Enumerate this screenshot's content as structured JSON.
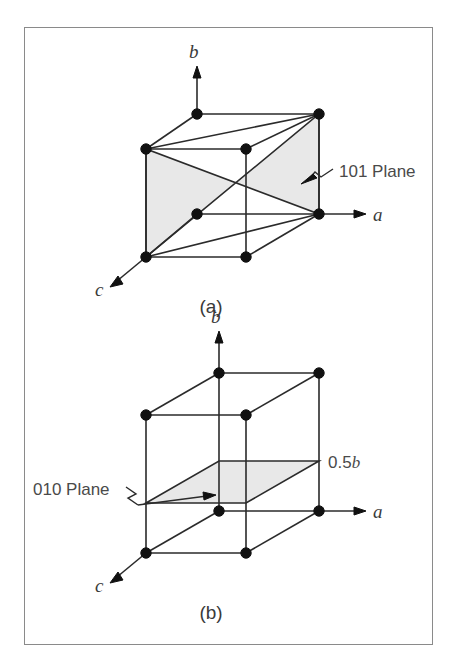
{
  "figure": {
    "background_color": "#ffffff",
    "frame_color": "#8a8a8a",
    "edge_color": "#2b2b2b",
    "vertex_color": "#111111",
    "plane_fill_color": "#e8e8e8",
    "text_color": "#3a3a3a"
  },
  "panel_a": {
    "caption": "(a)",
    "axis_a": "a",
    "axis_b": "b",
    "axis_c": "c",
    "plane_label": "101 Plane"
  },
  "panel_b": {
    "caption": "(b)",
    "axis_a": "a",
    "axis_b": "b",
    "axis_c": "c",
    "plane_label": "010 Plane",
    "height_label_value": "0.5",
    "height_label_axis": "b"
  },
  "chart_data": {
    "type": "diagram",
    "panels": [
      {
        "id": "a",
        "caption": "(a)",
        "description": "Unit cell cube with the (101) plane shaded; plane passes through the front-left vertical edge and the back-right vertical edge.",
        "axes": [
          "a",
          "b",
          "c"
        ],
        "annotations": [
          "101 Plane"
        ],
        "vertex_count": 8
      },
      {
        "id": "b",
        "caption": "(b)",
        "description": "Unit cell cube with a horizontal plane shaded at height 0.5b, labeled 010 Plane.",
        "axes": [
          "a",
          "b",
          "c"
        ],
        "annotations": [
          "010 Plane",
          "0.5b"
        ],
        "vertex_count": 8,
        "plane_height_fraction": 0.5
      }
    ]
  }
}
